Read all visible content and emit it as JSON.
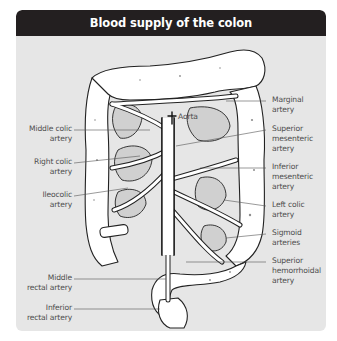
{
  "figure": {
    "title": "Blood supply of the colon",
    "colors": {
      "header_bg": "#231f20",
      "header_text": "#ffffff",
      "panel_bg": "#e6e6e6",
      "label_text": "#4d4d4d"
    }
  },
  "labels": {
    "aorta": "Aorta",
    "left": [
      {
        "id": "middle-colic",
        "line1": "Middle colic",
        "line2": "artery"
      },
      {
        "id": "right-colic",
        "line1": "Right colic",
        "line2": "artery"
      },
      {
        "id": "ileocolic",
        "line1": "Ileocolic",
        "line2": "artery"
      },
      {
        "id": "middle-rectal",
        "line1": "Middle",
        "line2": "rectal artery"
      },
      {
        "id": "inferior-rectal",
        "line1": "Inferior",
        "line2": "rectal artery"
      }
    ],
    "right": [
      {
        "id": "marginal",
        "line1": "Marginal",
        "line2": "artery"
      },
      {
        "id": "superior-mesenteric",
        "line1": "Superior",
        "line2": "mesenteric",
        "line3": "artery"
      },
      {
        "id": "inferior-mesenteric",
        "line1": "Inferior",
        "line2": "mesenteric",
        "line3": "artery"
      },
      {
        "id": "left-colic",
        "line1": "Left colic",
        "line2": "artery"
      },
      {
        "id": "sigmoid",
        "line1": "Sigmoid",
        "line2": "arteries"
      },
      {
        "id": "superior-hemorrhoidal",
        "line1": "Superior",
        "line2": "hemorrhoidal",
        "line3": "artery"
      }
    ]
  }
}
